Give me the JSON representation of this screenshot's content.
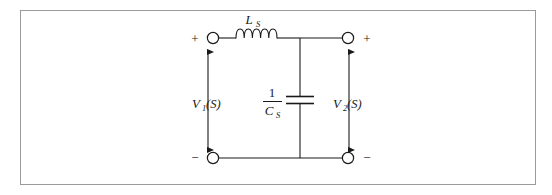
{
  "figure": {
    "type": "circuit-diagram",
    "background_color": "#ffffff",
    "border_color": "#9a9a9a",
    "line_color": "#1a1a1a",
    "text_color": "#1a1a1a"
  },
  "components": {
    "inductor": {
      "label_main": "L",
      "label_sub": "S",
      "coil_count": 5,
      "orientation": "horizontal",
      "position": "top-branch"
    },
    "capacitor": {
      "label_numerator": "1",
      "label_denominator_main": "C",
      "label_denominator_sub": "S",
      "plate_count": 2,
      "orientation": "vertical",
      "position": "shunt-middle"
    }
  },
  "ports": {
    "input": {
      "label_main": "V",
      "label_sub": "1",
      "label_arg": "(S)",
      "polarity_top": "+",
      "polarity_bottom": "−",
      "arrow": "double-headed-vertical"
    },
    "output": {
      "label_main": "V",
      "label_sub": "2",
      "label_arg": "(S)",
      "polarity_top": "+",
      "polarity_bottom": "−",
      "arrow": "double-headed-vertical"
    }
  },
  "terminals": [
    {
      "id": "top-left",
      "sign": "+",
      "sign_side": "left"
    },
    {
      "id": "top-right",
      "sign": "+",
      "sign_side": "right"
    },
    {
      "id": "bottom-left",
      "sign": "−",
      "sign_side": "left"
    },
    {
      "id": "bottom-right",
      "sign": "−",
      "sign_side": "right"
    }
  ]
}
